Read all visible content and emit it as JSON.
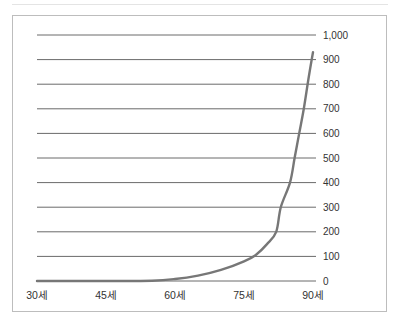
{
  "chart_data": {
    "type": "line",
    "title": "",
    "xlabel": "",
    "ylabel": "",
    "x_tick_labels": [
      "30세",
      "45세",
      "60세",
      "75세",
      "90세"
    ],
    "x_ticks": [
      30,
      45,
      60,
      75,
      90
    ],
    "y_tick_labels": [
      "0",
      "100",
      "200",
      "300",
      "400",
      "500",
      "600",
      "700",
      "800",
      "900",
      "1,000"
    ],
    "y_ticks": [
      0,
      100,
      200,
      300,
      400,
      500,
      600,
      700,
      800,
      900,
      1000
    ],
    "ylim": [
      0,
      1000
    ],
    "xlim": [
      30,
      90
    ],
    "grid": "horizontal",
    "y_axis_position": "right",
    "series": [
      {
        "name": "curve",
        "color": "#777777",
        "x": [
          30,
          45,
          55,
          60,
          65,
          70,
          75,
          77.5,
          80,
          82,
          83,
          85,
          86,
          87,
          88,
          89,
          90
        ],
        "values": [
          0,
          0,
          1,
          8,
          22,
          45,
          80,
          105,
          150,
          200,
          300,
          400,
          500,
          600,
          700,
          820,
          930
        ]
      }
    ]
  }
}
